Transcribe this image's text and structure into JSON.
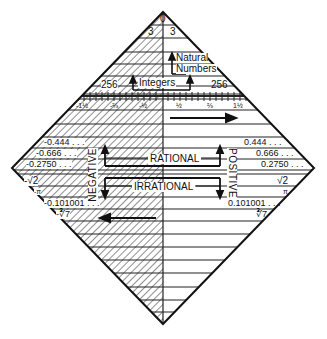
{
  "diagram": {
    "top": {
      "zero": "0",
      "three_left": "3",
      "three_right": "3"
    },
    "natural_numbers": {
      "line1": "Natural",
      "line2": "Numbers"
    },
    "integers": {
      "label": "Integers",
      "left_value": "256",
      "right_value": "256"
    },
    "fractions": {
      "left": [
        "-1½",
        "-⅔",
        "-½"
      ],
      "right": [
        "½",
        "⅔",
        "1½"
      ]
    },
    "rational": {
      "label": "RATIONAL",
      "left_values": [
        "-0.444 . . .",
        "-0.666 . . .",
        "-0.2750 . . ."
      ],
      "right_values": [
        "0.444 . . .",
        "0.666 . . .",
        "0.2750 . . ."
      ]
    },
    "irrational": {
      "label": "IRRATIONAL",
      "left_values": [
        "-√2",
        "-π",
        "-0.101001 . . .",
        "-∛7"
      ],
      "right_values": [
        "√2",
        "π",
        "0.101001 . . .",
        "∛7"
      ]
    },
    "side_labels": {
      "negative": "NEGATIVE",
      "positive": "POSITIVE"
    },
    "colors": {
      "ink": "#111111",
      "background": "#ffffff"
    }
  }
}
